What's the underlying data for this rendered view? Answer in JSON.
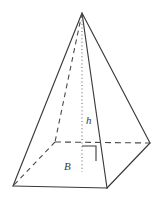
{
  "figure": {
    "name": "square-pyramid-diagram",
    "background_color": "#ffffff",
    "stroke_color": "#3a3a3a",
    "hidden_stroke_color": "#4a4a4a",
    "dotted_stroke_color": "#6e6e6e",
    "canvas": {
      "width": 163,
      "height": 198
    }
  },
  "labels": {
    "height_label": "h",
    "base_label": "B"
  },
  "geometry": {
    "apex": {
      "x": 82,
      "y": 13
    },
    "front_bottom_left": {
      "x": 13,
      "y": 186
    },
    "front_bottom_right": {
      "x": 107,
      "y": 188
    },
    "right_vertex": {
      "x": 150,
      "y": 143
    },
    "back_hidden_vertex": {
      "x": 55,
      "y": 142
    },
    "height_foot": {
      "x": 82,
      "y": 172
    },
    "right_angle_marker": {
      "x": 82,
      "y": 145,
      "size": 14
    }
  },
  "label_positions": {
    "height_label": {
      "x": 86,
      "y": 124
    },
    "base_label": {
      "x": 64,
      "y": 170
    }
  }
}
